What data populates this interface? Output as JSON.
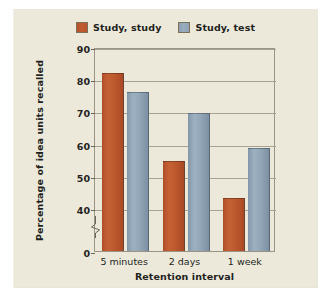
{
  "chart_data": {
    "type": "bar",
    "title": "",
    "xlabel": "Retention interval",
    "ylabel": "Percentage of idea units recalled",
    "categories": [
      "5 minutes",
      "2 days",
      "1 week"
    ],
    "series": [
      {
        "name": "Study, study",
        "color": "#bf5a2e",
        "values": [
          82,
          54.5,
          43
        ]
      },
      {
        "name": "Study, test",
        "color": "#93a7b8",
        "values": [
          76,
          69.5,
          58.5
        ]
      }
    ],
    "ylim": [
      0,
      90
    ],
    "yticks": [
      90,
      80,
      70,
      60,
      50,
      40,
      0
    ],
    "y_axis_break": true,
    "y_axis_break_between": [
      0,
      40
    ],
    "grid": "horizontal",
    "legend_position": "top-center"
  },
  "legend": {
    "entries": [
      {
        "label": "Study, study",
        "swatch": "orange-swatch-icon"
      },
      {
        "label": "Study, test",
        "swatch": "blue-swatch-icon"
      }
    ]
  },
  "axes": {
    "y_title": "Percentage of idea units recalled",
    "x_title": "Retention interval",
    "y_ticks": [
      "90",
      "80",
      "70",
      "60",
      "50",
      "40",
      "0"
    ],
    "x_ticks": [
      "5 minutes",
      "2 days",
      "1 week"
    ]
  },
  "colors": {
    "panel_background": "#ece9db",
    "page_background": "#ffffff",
    "series_study": "#bf5a2e",
    "series_test": "#93a7b8",
    "gridline": "#a8a295",
    "text": "#231f1c"
  }
}
